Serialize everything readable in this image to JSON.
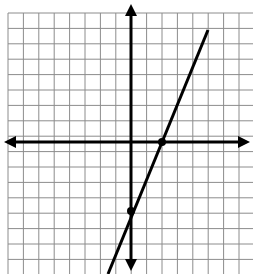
{
  "figure": {
    "width": 253,
    "height": 274,
    "background_color": "#ffffff",
    "title": ""
  },
  "grid": {
    "color": "#8c8c8c",
    "line_width": 1,
    "cell_size_px": 15.4,
    "origin_px": {
      "x": 131,
      "y": 142
    },
    "left_px": 8,
    "top_px": 13,
    "columns": 16,
    "rows": 17,
    "x_min": -8,
    "x_max": 8,
    "y_min": -8.5,
    "y_max": 8.5,
    "show_tick_labels": false,
    "show_axis_labels": false
  },
  "axes": {
    "color": "#000000",
    "line_width": 3,
    "arrowheads": [
      "left",
      "right",
      "up",
      "down"
    ],
    "x_axis_label": "",
    "y_axis_label": ""
  },
  "chart_data": {
    "type": "line",
    "title": "",
    "xlabel": "",
    "ylabel": "",
    "xlim": [
      -8,
      8
    ],
    "ylim": [
      -8.5,
      8.5
    ],
    "grid": true,
    "legend": "none",
    "series": [
      {
        "name": "line",
        "color": "#000000",
        "line_width": 3,
        "slope": 2.2,
        "y_intercept": -4.5,
        "equation": "y = 2.2x - 4.5",
        "x": [
          -1.5,
          5.0
        ],
        "y": [
          -7.8,
          6.5
        ],
        "endpoints_px": [
          {
            "x": 108,
            "y": 274
          },
          {
            "x": 208,
            "y": 30
          }
        ]
      }
    ],
    "points": [
      {
        "label": "x-intercept",
        "x": 2,
        "y": 0,
        "px": {
          "x": 162,
          "y": 142
        },
        "color": "#000000",
        "radius_px": 4
      },
      {
        "label": "y-intercept",
        "x": 0,
        "y": -4.5,
        "px": {
          "x": 131,
          "y": 211
        },
        "color": "#000000",
        "radius_px": 4
      }
    ]
  }
}
